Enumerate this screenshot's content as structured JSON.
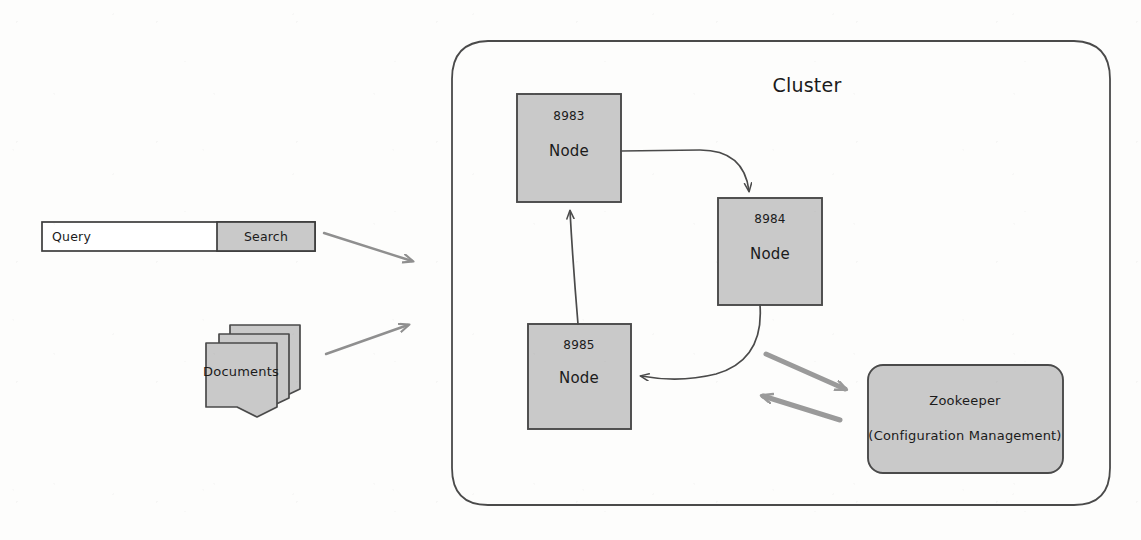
{
  "figure": {
    "title": "Cluster",
    "style": "hand-drawn scanned whiteboard diagram",
    "colors": {
      "shape_fill": "#c9c9c9",
      "shape_stroke": "#4a4a4a",
      "text": "#1b1b1b",
      "connector": "#4a4a4a",
      "gray_arrow": "#9a9a9a",
      "page_background": "#fdfdfc"
    }
  },
  "cluster": {
    "label": "Cluster",
    "nodes": [
      {
        "port": "8983",
        "label": "Node"
      },
      {
        "port": "8984",
        "label": "Node"
      },
      {
        "port": "8985",
        "label": "Node"
      }
    ],
    "zookeeper": {
      "title": "Zookeeper",
      "subtitle": "(Configuration Management)"
    }
  },
  "inputs": {
    "search_bar": {
      "query_value": "Query",
      "button_label": "Search"
    },
    "documents": {
      "label": "Documents",
      "sheet_count": 3
    }
  },
  "connections": [
    {
      "name": "query-to-cluster",
      "from": "search-bar",
      "to": "cluster",
      "style": "gray-arrow"
    },
    {
      "name": "documents-to-cluster",
      "from": "documents",
      "to": "cluster",
      "style": "gray-arrow"
    },
    {
      "name": "node-8983-to-8984",
      "from": "8983",
      "to": "8984",
      "style": "curve-arrow"
    },
    {
      "name": "node-8984-to-8985",
      "from": "8984",
      "to": "8985",
      "style": "curve-arrow"
    },
    {
      "name": "node-8985-to-8983",
      "from": "8985",
      "to": "8983",
      "style": "line-arrow"
    },
    {
      "name": "cluster-to-zookeeper",
      "from": "nodes",
      "to": "zookeeper",
      "style": "gray-arrow"
    },
    {
      "name": "zookeeper-to-cluster",
      "from": "zookeeper",
      "to": "nodes",
      "style": "gray-arrow"
    }
  ]
}
